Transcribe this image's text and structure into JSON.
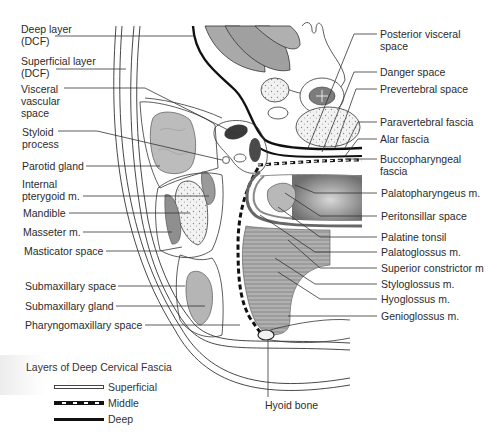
{
  "figure": {
    "type": "anatomical cross-section"
  },
  "labels_left": [
    {
      "id": "deep-layer",
      "lines": [
        "Deep layer",
        "(DCF)"
      ]
    },
    {
      "id": "superficial-layer",
      "lines": [
        "Superficial layer",
        "(DCF)"
      ]
    },
    {
      "id": "visceral-vascular-space",
      "lines": [
        "Visceral",
        "vascular",
        "space"
      ]
    },
    {
      "id": "styloid-process",
      "lines": [
        "Styloid",
        "process"
      ]
    },
    {
      "id": "parotid-gland",
      "lines": [
        "Parotid gland"
      ]
    },
    {
      "id": "internal-pterygoid",
      "lines": [
        "Internal",
        "pterygoid m."
      ]
    },
    {
      "id": "mandible",
      "lines": [
        "Mandible"
      ]
    },
    {
      "id": "masseter",
      "lines": [
        "Masseter m."
      ]
    },
    {
      "id": "masticator-space",
      "lines": [
        "Masticator space"
      ]
    },
    {
      "id": "submaxillary-space",
      "lines": [
        "Submaxillary space"
      ]
    },
    {
      "id": "submaxillary-gland",
      "lines": [
        "Submaxillary gland"
      ]
    },
    {
      "id": "pharyngomaxillary-space",
      "lines": [
        "Pharyngomaxillary space"
      ]
    }
  ],
  "labels_right": [
    {
      "id": "posterior-visceral-space",
      "lines": [
        "Posterior visceral",
        "space"
      ]
    },
    {
      "id": "danger-space",
      "lines": [
        "Danger space"
      ]
    },
    {
      "id": "prevertebral-space",
      "lines": [
        "Prevertebral space"
      ]
    },
    {
      "id": "paravertebral-fascia",
      "lines": [
        "Paravertebral fascia"
      ]
    },
    {
      "id": "alar-fascia",
      "lines": [
        "Alar fascia"
      ]
    },
    {
      "id": "buccopharyngeal-fascia",
      "lines": [
        "Buccopharyngeal",
        "fascia"
      ]
    },
    {
      "id": "palatopharyngeus",
      "lines": [
        "Palatopharyngeus m."
      ]
    },
    {
      "id": "peritonsillar-space",
      "lines": [
        "Peritonsillar space"
      ]
    },
    {
      "id": "palatine-tonsil",
      "lines": [
        "Palatine tonsil"
      ]
    },
    {
      "id": "palatoglossus",
      "lines": [
        "Palatoglossus m."
      ]
    },
    {
      "id": "superior-constrictor",
      "lines": [
        "Superior constrictor m"
      ]
    },
    {
      "id": "styloglossus",
      "lines": [
        "Styloglossus m."
      ]
    },
    {
      "id": "hyoglossus",
      "lines": [
        "Hyoglossus m."
      ]
    },
    {
      "id": "genioglossus",
      "lines": [
        "Genioglossus m."
      ]
    }
  ],
  "label_bottom": {
    "id": "hyoid-bone",
    "lines": [
      "Hyoid bone"
    ]
  },
  "legend": {
    "title": "Layers of Deep Cervical Fascia",
    "items": [
      {
        "label": "Superficial",
        "style": "double-line"
      },
      {
        "label": "Middle",
        "style": "dashed-black-white"
      },
      {
        "label": "Deep",
        "style": "solid-black"
      }
    ]
  },
  "colors": {
    "line": "#1a1a1a",
    "gland_fill": "#b9b9b9",
    "muscle_fill": "#9a9a9a",
    "bone_fill": "#e6e6e6",
    "dark_structure": "#3a3a3a"
  }
}
